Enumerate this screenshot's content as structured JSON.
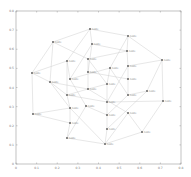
{
  "chart_data": {
    "type": "network",
    "title": "",
    "xlabel": "",
    "ylabel": "",
    "axes": {
      "box": {
        "left": 16,
        "top": 11,
        "right": 181,
        "bottom": 164
      },
      "x_ticks": [
        "0",
        "0.1",
        "0.2",
        "0.3",
        "0.4",
        "0.5",
        "0.6",
        "0.7",
        "0.8"
      ],
      "y_ticks": [
        "0.8",
        "0.7",
        "0.6",
        "0.5",
        "0.4",
        "0.3",
        "0.2",
        "0.1",
        "0"
      ]
    },
    "nodes": [
      {
        "id": "n0",
        "label": "node",
        "x": 90,
        "y": 29
      },
      {
        "id": "n1",
        "label": "node",
        "x": 53,
        "y": 42
      },
      {
        "id": "n2",
        "label": "node",
        "x": 128,
        "y": 36
      },
      {
        "id": "n3",
        "label": "node",
        "x": 92,
        "y": 44
      },
      {
        "id": "n4",
        "label": "node",
        "x": 127,
        "y": 51
      },
      {
        "id": "n5",
        "label": "node",
        "x": 67,
        "y": 61
      },
      {
        "id": "n6",
        "label": "node",
        "x": 88,
        "y": 59
      },
      {
        "id": "n7",
        "label": "node",
        "x": 162,
        "y": 60
      },
      {
        "id": "n8",
        "label": "node",
        "x": 32,
        "y": 73
      },
      {
        "id": "n9",
        "label": "node",
        "x": 88,
        "y": 72
      },
      {
        "id": "n10",
        "label": "node",
        "x": 110,
        "y": 68
      },
      {
        "id": "n11",
        "label": "node",
        "x": 128,
        "y": 66
      },
      {
        "id": "n12",
        "label": "node",
        "x": 50,
        "y": 82
      },
      {
        "id": "n13",
        "label": "node",
        "x": 70,
        "y": 79
      },
      {
        "id": "n14",
        "label": "node",
        "x": 107,
        "y": 84
      },
      {
        "id": "n15",
        "label": "node",
        "x": 128,
        "y": 79
      },
      {
        "id": "n16",
        "label": "node",
        "x": 88,
        "y": 89
      },
      {
        "id": "n17",
        "label": "node",
        "x": 67,
        "y": 95
      },
      {
        "id": "n18",
        "label": "node",
        "x": 147,
        "y": 91
      },
      {
        "id": "n19",
        "label": "node",
        "x": 128,
        "y": 95
      },
      {
        "id": "n20",
        "label": "node",
        "x": 107,
        "y": 102
      },
      {
        "id": "n21",
        "label": "node",
        "x": 163,
        "y": 101
      },
      {
        "id": "n22",
        "label": "node",
        "x": 70,
        "y": 108
      },
      {
        "id": "n23",
        "label": "node",
        "x": 86,
        "y": 106
      },
      {
        "id": "n24",
        "label": "node",
        "x": 33,
        "y": 114
      },
      {
        "id": "n25",
        "label": "node",
        "x": 107,
        "y": 115
      },
      {
        "id": "n26",
        "label": "node",
        "x": 128,
        "y": 113
      },
      {
        "id": "n27",
        "label": "node",
        "x": 70,
        "y": 123
      },
      {
        "id": "n28",
        "label": "node",
        "x": 107,
        "y": 129
      },
      {
        "id": "n29",
        "label": "node",
        "x": 142,
        "y": 132
      },
      {
        "id": "n30",
        "label": "node",
        "x": 67,
        "y": 138
      },
      {
        "id": "n31",
        "label": "node",
        "x": 105,
        "y": 144
      }
    ],
    "edges": [
      [
        0,
        1
      ],
      [
        0,
        2
      ],
      [
        0,
        3
      ],
      [
        0,
        5
      ],
      [
        1,
        8
      ],
      [
        1,
        12
      ],
      [
        1,
        6
      ],
      [
        2,
        4
      ],
      [
        2,
        7
      ],
      [
        2,
        10
      ],
      [
        3,
        4
      ],
      [
        3,
        9
      ],
      [
        4,
        6
      ],
      [
        4,
        11
      ],
      [
        5,
        13
      ],
      [
        5,
        8
      ],
      [
        5,
        17
      ],
      [
        6,
        9
      ],
      [
        6,
        14
      ],
      [
        7,
        11
      ],
      [
        7,
        18
      ],
      [
        7,
        21
      ],
      [
        8,
        12
      ],
      [
        8,
        24
      ],
      [
        9,
        16
      ],
      [
        9,
        15
      ],
      [
        10,
        14
      ],
      [
        10,
        13
      ],
      [
        11,
        15
      ],
      [
        11,
        20
      ],
      [
        12,
        17
      ],
      [
        12,
        22
      ],
      [
        13,
        23
      ],
      [
        14,
        16
      ],
      [
        14,
        20
      ],
      [
        15,
        19
      ],
      [
        16,
        17
      ],
      [
        16,
        26
      ],
      [
        17,
        20
      ],
      [
        17,
        22
      ],
      [
        18,
        19
      ],
      [
        18,
        28
      ],
      [
        19,
        25
      ],
      [
        20,
        25
      ],
      [
        20,
        21
      ],
      [
        21,
        29
      ],
      [
        22,
        27
      ],
      [
        22,
        31
      ],
      [
        23,
        25
      ],
      [
        23,
        30
      ],
      [
        24,
        27
      ],
      [
        24,
        22
      ],
      [
        25,
        28
      ],
      [
        26,
        29
      ],
      [
        26,
        31
      ],
      [
        27,
        30
      ],
      [
        28,
        31
      ],
      [
        29,
        31
      ],
      [
        30,
        31
      ],
      [
        3,
        13
      ],
      [
        10,
        19
      ],
      [
        12,
        16
      ]
    ],
    "colors": {
      "edge": "#cfcfcf",
      "node": "#888888",
      "axis": "#999999"
    }
  }
}
